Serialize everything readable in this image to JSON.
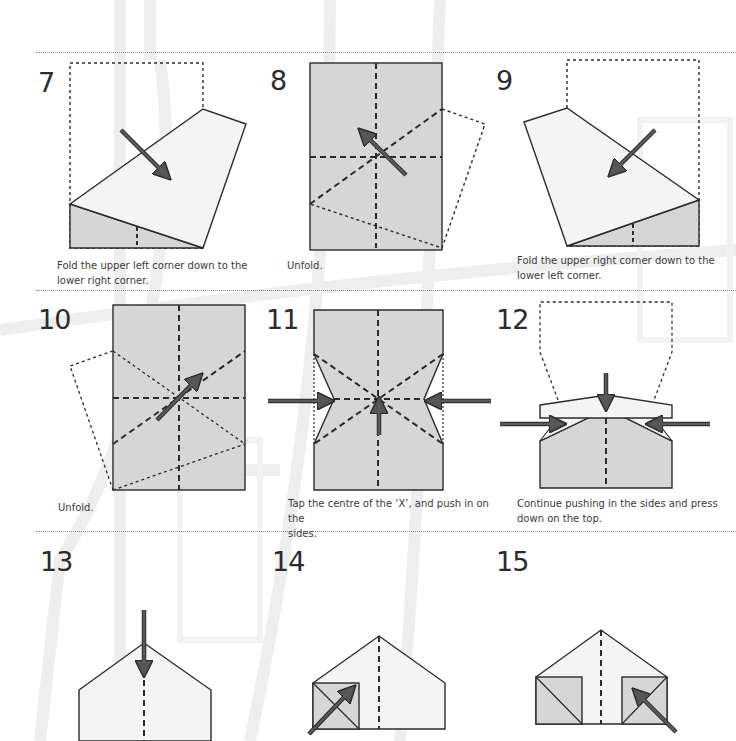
{
  "page": {
    "colors": {
      "paper_light": "#f4f4f4",
      "paper_shaded": "#d6d6d6",
      "outline": "#2b2b2b",
      "arrow": "#5a5a5a",
      "divider": "#8a8a8a",
      "watermark": "#ececec"
    }
  },
  "steps": [
    {
      "number": "7",
      "caption": "Fold the upper left corner down to the lower right corner.",
      "caption_lines": [
        "Fold the upper left corner down to the",
        "lower right corner."
      ]
    },
    {
      "number": "8",
      "caption": "Unfold.",
      "caption_lines": [
        "Unfold."
      ]
    },
    {
      "number": "9",
      "caption": "Fold the upper right corner down to the lower left corner.",
      "caption_lines": [
        "Fold the upper right corner down to the",
        "lower left corner."
      ]
    },
    {
      "number": "10",
      "caption": "Unfold.",
      "caption_lines": [
        "Unfold."
      ]
    },
    {
      "number": "11",
      "caption": "Tap the centre of the ‘X’, and push in on the sides.",
      "caption_lines": [
        "Tap the centre of the ‘X’, and push in on the",
        "sides."
      ]
    },
    {
      "number": "12",
      "caption": "Continue pushing in the sides and press down on the top.",
      "caption_lines": [
        "Continue pushing in the sides and press",
        "down on the top."
      ]
    },
    {
      "number": "13",
      "caption": "",
      "caption_lines": []
    },
    {
      "number": "14",
      "caption": "",
      "caption_lines": []
    },
    {
      "number": "15",
      "caption": "",
      "caption_lines": []
    }
  ]
}
